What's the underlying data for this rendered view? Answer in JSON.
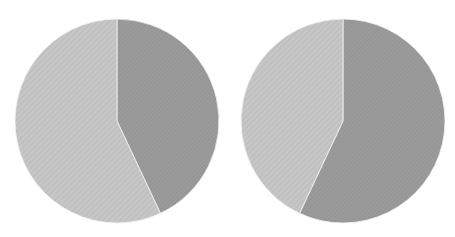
{
  "chart_data": [
    {
      "type": "pie",
      "title": "",
      "categories": [
        "Slice A (dark)",
        "Slice B (light)"
      ],
      "values": [
        43,
        57
      ],
      "colors": [
        "#9b9b9b",
        "#c6c6c6"
      ],
      "start_angle": "12 o'clock, clockwise",
      "legend": "none",
      "labels": "none"
    },
    {
      "type": "pie",
      "title": "",
      "categories": [
        "Slice A (dark)",
        "Slice B (light)"
      ],
      "values": [
        57,
        43
      ],
      "colors": [
        "#9b9b9b",
        "#c6c6c6"
      ],
      "start_angle": "12 o'clock, clockwise",
      "legend": "none",
      "labels": "none"
    }
  ],
  "layout": {
    "pies": [
      {
        "cx": 117,
        "cy": 121,
        "r": 102
      },
      {
        "cx": 343,
        "cy": 121,
        "r": 102
      }
    ]
  }
}
